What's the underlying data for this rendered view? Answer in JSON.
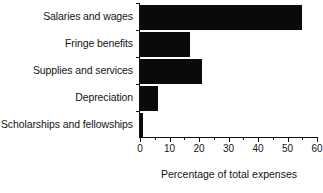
{
  "chart_data": {
    "type": "bar",
    "orientation": "horizontal",
    "title": "",
    "xlabel": "Percentage of total expenses",
    "ylabel": "",
    "xlim": [
      0,
      60
    ],
    "grid": false,
    "legend": "none",
    "xticks": [
      0,
      10,
      20,
      30,
      40,
      50,
      60
    ],
    "xtick_labels": [
      "0",
      "10",
      "20",
      "30",
      "40",
      "50",
      "60"
    ],
    "minor_tick_step": 5,
    "bar_color": "#0a0a0a",
    "categories": [
      "Salaries and wages",
      "Fringe benefits",
      "Supplies and services",
      "Depreciation",
      "Scholarships and fellowships"
    ],
    "values": [
      55,
      17,
      21,
      6,
      1
    ]
  }
}
